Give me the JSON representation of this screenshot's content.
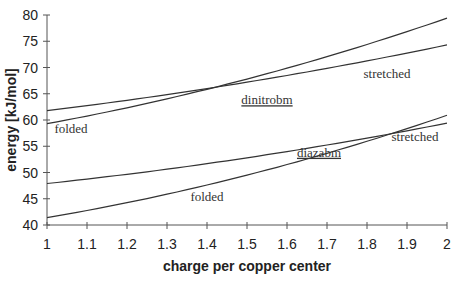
{
  "chart_data": {
    "type": "line",
    "title": "",
    "xlabel": "charge per copper center",
    "ylabel": "energy [kJ/mol]",
    "xlim": [
      1,
      2
    ],
    "ylim": [
      40,
      80
    ],
    "xticks": [
      "1",
      "1.1",
      "1.2",
      "1.3",
      "1.4",
      "1.5",
      "1.6",
      "1.7",
      "1.8",
      "1.9",
      "2"
    ],
    "yticks": [
      "40",
      "45",
      "50",
      "55",
      "60",
      "65",
      "70",
      "75",
      "80"
    ],
    "grid": false,
    "legend": null,
    "series": [
      {
        "name": "dinitrobm stretched",
        "x": [
          1,
          1.5,
          2
        ],
        "values": [
          61.8,
          67.2,
          74.3
        ]
      },
      {
        "name": "dinitrobm folded",
        "x": [
          1,
          1.5,
          2
        ],
        "values": [
          59.3,
          67.8,
          79.4
        ]
      },
      {
        "name": "diazabm stretched",
        "x": [
          1,
          1.5,
          2
        ],
        "values": [
          47.9,
          52.8,
          59.4
        ]
      },
      {
        "name": "diazabm folded",
        "x": [
          1,
          1.5,
          2
        ],
        "values": [
          41.4,
          49.5,
          60.9
        ]
      }
    ],
    "annotations": [
      {
        "text": "dinitrobm",
        "underline": true,
        "x": 1.55,
        "y": 63
      },
      {
        "text": "diazabm",
        "underline": true,
        "x": 1.68,
        "y": 53
      },
      {
        "text": "folded",
        "x": 1.06,
        "y": 57.5
      },
      {
        "text": "stretched",
        "x": 1.85,
        "y": 68
      },
      {
        "text": "folded",
        "x": 1.4,
        "y": 44.5
      },
      {
        "text": "stretched",
        "x": 1.92,
        "y": 56
      }
    ]
  },
  "labels": {
    "compound_upper": "dinitrobm",
    "compound_lower": "diazabm",
    "folded": "folded",
    "stretched": "stretched"
  }
}
